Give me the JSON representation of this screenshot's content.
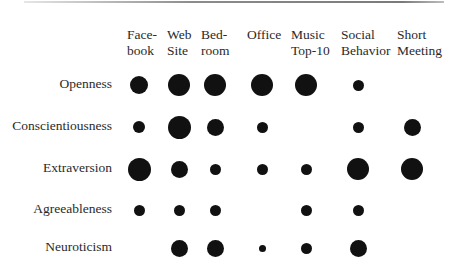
{
  "chart_data": {
    "type": "bubble-matrix",
    "title": "",
    "columns": [
      "Facebook",
      "Web Site",
      "Bedroom",
      "Office",
      "Music Top-10",
      "Social Behavior",
      "Short Meeting"
    ],
    "column_labels": [
      "Face-\nbook",
      "Web\nSite",
      "Bed-\nroom",
      "Office",
      "Music\nTop-10",
      "Social\nBehavior",
      "Short\nMeeting"
    ],
    "rows": [
      "Openness",
      "Conscientiousness",
      "Extraversion",
      "Agreeableness",
      "Neuroticism"
    ],
    "size_unit": "approx. dot diameter in px (0 = no dot)",
    "values": [
      [
        18,
        22,
        22,
        22,
        22,
        11,
        0
      ],
      [
        12,
        23,
        17,
        11,
        0,
        11,
        17
      ],
      [
        23,
        17,
        11,
        11,
        11,
        22,
        22
      ],
      [
        11,
        11,
        11,
        0,
        11,
        11,
        0
      ],
      [
        0,
        17,
        17,
        7,
        11,
        17,
        0
      ]
    ],
    "dot_color": "#111111",
    "xlabel": "",
    "ylabel": "",
    "grid": false,
    "legend": null
  },
  "layout": {
    "col_x": [
      139,
      179,
      215,
      262,
      306,
      358,
      412
    ],
    "header_left": [
      127,
      167,
      201,
      247,
      291,
      341,
      397
    ],
    "row_y": [
      85,
      127,
      169,
      210,
      248
    ]
  }
}
